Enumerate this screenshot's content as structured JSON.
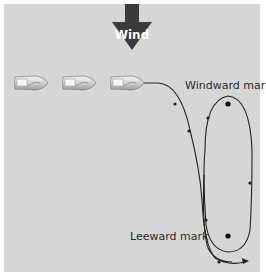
{
  "diagram": {
    "wind_label": "Wind",
    "windward_mark_label": "Windward mark",
    "leeward_mark_label": "Leeward mark",
    "boats": [
      {
        "name": "boat-1"
      },
      {
        "name": "boat-2"
      },
      {
        "name": "boat-3"
      }
    ],
    "colors": {
      "background": "#d6d6d6",
      "arrow": "#3a3a3a",
      "course_line": "#222222",
      "mark": "#111111"
    }
  }
}
